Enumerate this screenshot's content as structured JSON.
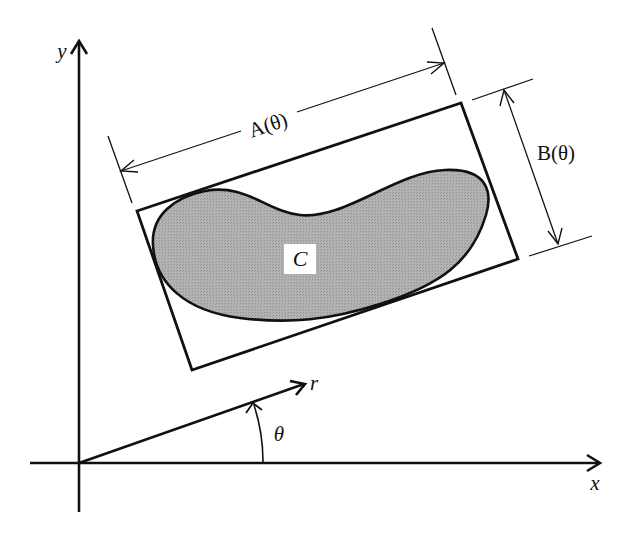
{
  "diagram": {
    "colors": {
      "stroke": "#111111",
      "region_fill": "#b0b0b0",
      "background": "#ffffff",
      "label_box": "#ffffff"
    },
    "axes": {
      "x_label": "x",
      "y_label": "y"
    },
    "ray": {
      "label": "r",
      "angle_label": "θ"
    },
    "region": {
      "label": "C"
    },
    "dimensions": {
      "length_label": "A(θ)",
      "width_label": "B(θ)"
    }
  }
}
